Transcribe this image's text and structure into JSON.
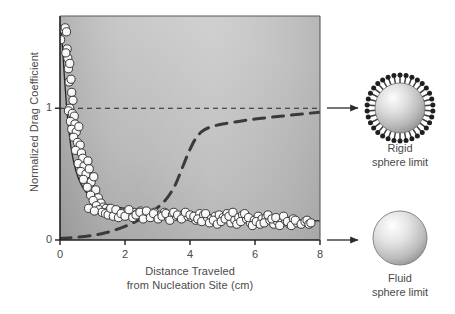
{
  "figure": {
    "background": "#ffffff",
    "plot_bg_light": "#c8c8c8",
    "plot_bg_dark": "#9e9e9e",
    "axis_color": "#222222",
    "text_color": "#4a4a4a",
    "marker_fill": "#f2f2f2",
    "marker_edge": "#3a3a3a"
  },
  "chart_data": {
    "type": "scatter",
    "title": "",
    "subtitle": "",
    "xlabel": "Distance Traveled from Nucleation Site (cm)",
    "xlabel_lines": [
      "Distance Traveled",
      "from Nucleation Site (cm)"
    ],
    "ylabel": "Normalized Drag Coefficient",
    "xlim": [
      0,
      8
    ],
    "ylim": [
      0,
      1.7
    ],
    "xticks": [
      0,
      2,
      4,
      6,
      8
    ],
    "xticklabels": [
      "0",
      "2",
      "4",
      "6",
      "8"
    ],
    "yticks": [
      0,
      1
    ],
    "yticklabels": [
      "0",
      "1"
    ],
    "grid": false,
    "legend": "none",
    "series": [
      {
        "name": "Measured normalized drag coefficient",
        "type": "scatter",
        "marker": "filled-circle",
        "points": [
          [
            0.02,
            1.52
          ],
          [
            0.1,
            1.6
          ],
          [
            0.16,
            1.61
          ],
          [
            0.2,
            1.58
          ],
          [
            0.22,
            1.45
          ],
          [
            0.24,
            1.38
          ],
          [
            0.26,
            1.3
          ],
          [
            0.18,
            1.42
          ],
          [
            0.3,
            1.34
          ],
          [
            0.28,
            1.2
          ],
          [
            0.34,
            1.22
          ],
          [
            0.36,
            1.12
          ],
          [
            0.4,
            1.06
          ],
          [
            0.3,
            1.0
          ],
          [
            0.26,
            0.98
          ],
          [
            0.38,
            0.96
          ],
          [
            0.44,
            0.94
          ],
          [
            0.32,
            0.9
          ],
          [
            0.46,
            0.88
          ],
          [
            0.36,
            0.84
          ],
          [
            0.5,
            0.82
          ],
          [
            0.58,
            0.86
          ],
          [
            0.42,
            0.78
          ],
          [
            0.54,
            0.74
          ],
          [
            0.62,
            0.72
          ],
          [
            0.48,
            0.68
          ],
          [
            0.66,
            0.66
          ],
          [
            0.7,
            0.62
          ],
          [
            0.56,
            0.58
          ],
          [
            0.74,
            0.56
          ],
          [
            0.86,
            0.6
          ],
          [
            0.64,
            0.52
          ],
          [
            0.8,
            0.5
          ],
          [
            0.9,
            0.54
          ],
          [
            0.72,
            0.46
          ],
          [
            0.96,
            0.44
          ],
          [
            1.04,
            0.48
          ],
          [
            0.84,
            0.4
          ],
          [
            1.1,
            0.38
          ],
          [
            0.94,
            0.34
          ],
          [
            1.18,
            0.32
          ],
          [
            1.02,
            0.3
          ],
          [
            1.26,
            0.28
          ],
          [
            1.12,
            0.26
          ],
          [
            0.88,
            0.24
          ],
          [
            1.34,
            0.25
          ],
          [
            1.2,
            0.23
          ],
          [
            1.42,
            0.24
          ],
          [
            1.06,
            0.22
          ],
          [
            1.5,
            0.22
          ],
          [
            1.3,
            0.21
          ],
          [
            1.58,
            0.23
          ],
          [
            1.4,
            0.2
          ],
          [
            1.66,
            0.21
          ],
          [
            1.48,
            0.19
          ],
          [
            1.74,
            0.22
          ],
          [
            1.56,
            0.24
          ],
          [
            1.82,
            0.2
          ],
          [
            1.64,
            0.18
          ],
          [
            1.9,
            0.19
          ],
          [
            1.72,
            0.23
          ],
          [
            1.98,
            0.21
          ],
          [
            1.8,
            0.17
          ],
          [
            2.08,
            0.22
          ],
          [
            1.88,
            0.2
          ],
          [
            2.18,
            0.19
          ],
          [
            2.0,
            0.18
          ],
          [
            2.28,
            0.21
          ],
          [
            2.12,
            0.23
          ],
          [
            2.38,
            0.2
          ],
          [
            2.24,
            0.17
          ],
          [
            2.48,
            0.22
          ],
          [
            2.34,
            0.19
          ],
          [
            2.58,
            0.18
          ],
          [
            2.46,
            0.21
          ],
          [
            2.68,
            0.2
          ],
          [
            2.56,
            0.16
          ],
          [
            2.78,
            0.19
          ],
          [
            2.66,
            0.22
          ],
          [
            2.9,
            0.21
          ],
          [
            2.78,
            0.17
          ],
          [
            3.0,
            0.18
          ],
          [
            2.88,
            0.2
          ],
          [
            3.12,
            0.19
          ],
          [
            3.02,
            0.16
          ],
          [
            3.22,
            0.21
          ],
          [
            3.14,
            0.18
          ],
          [
            3.34,
            0.17
          ],
          [
            3.26,
            0.2
          ],
          [
            3.46,
            0.19
          ],
          [
            3.38,
            0.15
          ],
          [
            3.58,
            0.18
          ],
          [
            3.5,
            0.21
          ],
          [
            3.7,
            0.17
          ],
          [
            3.62,
            0.19
          ],
          [
            3.82,
            0.2
          ],
          [
            3.74,
            0.16
          ],
          [
            3.94,
            0.18
          ],
          [
            3.86,
            0.21
          ],
          [
            4.06,
            0.17
          ],
          [
            4.0,
            0.19
          ],
          [
            4.18,
            0.15
          ],
          [
            4.12,
            0.18
          ],
          [
            4.3,
            0.2
          ],
          [
            4.24,
            0.16
          ],
          [
            4.42,
            0.19
          ],
          [
            4.36,
            0.14
          ],
          [
            4.54,
            0.17
          ],
          [
            4.48,
            0.2
          ],
          [
            4.66,
            0.16
          ],
          [
            4.6,
            0.13
          ],
          [
            4.78,
            0.18
          ],
          [
            4.72,
            0.15
          ],
          [
            4.9,
            0.19
          ],
          [
            4.84,
            0.12
          ],
          [
            5.02,
            0.17
          ],
          [
            4.96,
            0.14
          ],
          [
            5.14,
            0.2
          ],
          [
            5.08,
            0.16
          ],
          [
            5.26,
            0.13
          ],
          [
            5.2,
            0.18
          ],
          [
            5.38,
            0.15
          ],
          [
            5.32,
            0.21
          ],
          [
            5.5,
            0.17
          ],
          [
            5.44,
            0.12
          ],
          [
            5.62,
            0.19
          ],
          [
            5.56,
            0.14
          ],
          [
            5.74,
            0.16
          ],
          [
            5.68,
            0.2
          ],
          [
            5.86,
            0.13
          ],
          [
            5.8,
            0.17
          ],
          [
            5.98,
            0.15
          ],
          [
            5.92,
            0.11
          ],
          [
            6.1,
            0.18
          ],
          [
            6.04,
            0.14
          ],
          [
            6.22,
            0.16
          ],
          [
            6.16,
            0.12
          ],
          [
            6.34,
            0.17
          ],
          [
            6.28,
            0.13
          ],
          [
            6.46,
            0.15
          ],
          [
            6.4,
            0.19
          ],
          [
            6.58,
            0.12
          ],
          [
            6.52,
            0.16
          ],
          [
            6.7,
            0.14
          ],
          [
            6.64,
            0.17
          ],
          [
            6.82,
            0.13
          ],
          [
            6.76,
            0.11
          ],
          [
            6.94,
            0.15
          ],
          [
            6.88,
            0.18
          ],
          [
            7.06,
            0.12
          ],
          [
            7.0,
            0.14
          ],
          [
            7.18,
            0.16
          ],
          [
            7.12,
            0.11
          ],
          [
            7.3,
            0.13
          ],
          [
            7.24,
            0.15
          ],
          [
            7.42,
            0.12
          ],
          [
            7.54,
            0.14
          ],
          [
            7.6,
            0.15
          ],
          [
            7.66,
            0.12
          ],
          [
            7.72,
            0.13
          ]
        ]
      },
      {
        "name": "Fit to measured data (decaying)",
        "type": "line",
        "style": "solid-thin",
        "description": "Steep decay from ~1.6 at x=0 to plateau ~0.14 at x=8",
        "points": [
          [
            0.03,
            1.62
          ],
          [
            0.08,
            1.45
          ],
          [
            0.14,
            1.22
          ],
          [
            0.2,
            1.02
          ],
          [
            0.26,
            0.86
          ],
          [
            0.34,
            0.7
          ],
          [
            0.44,
            0.57
          ],
          [
            0.56,
            0.47
          ],
          [
            0.7,
            0.4
          ],
          [
            0.88,
            0.34
          ],
          [
            1.1,
            0.3
          ],
          [
            1.35,
            0.275
          ],
          [
            1.65,
            0.255
          ],
          [
            2.0,
            0.24
          ],
          [
            2.4,
            0.228
          ],
          [
            2.85,
            0.215
          ],
          [
            3.35,
            0.203
          ],
          [
            3.9,
            0.192
          ],
          [
            4.5,
            0.182
          ],
          [
            5.1,
            0.172
          ],
          [
            5.7,
            0.164
          ],
          [
            6.3,
            0.157
          ],
          [
            6.9,
            0.151
          ],
          [
            7.5,
            0.147
          ],
          [
            8.0,
            0.145
          ]
        ]
      },
      {
        "name": "Rigid sphere transition (dashed sigmoid)",
        "type": "line",
        "style": "dashed-thick",
        "description": "Rises from ~0.01 at x=0, inflection near x=3.9, plateaus just below 1",
        "points": [
          [
            0.0,
            0.012
          ],
          [
            0.5,
            0.02
          ],
          [
            1.0,
            0.035
          ],
          [
            1.4,
            0.055
          ],
          [
            1.8,
            0.085
          ],
          [
            2.2,
            0.125
          ],
          [
            2.6,
            0.175
          ],
          [
            3.0,
            0.245
          ],
          [
            3.3,
            0.32
          ],
          [
            3.55,
            0.42
          ],
          [
            3.75,
            0.54
          ],
          [
            3.95,
            0.66
          ],
          [
            4.15,
            0.76
          ],
          [
            4.35,
            0.82
          ],
          [
            4.6,
            0.855
          ],
          [
            5.0,
            0.88
          ],
          [
            5.5,
            0.9
          ],
          [
            6.0,
            0.918
          ],
          [
            6.5,
            0.932
          ],
          [
            7.0,
            0.945
          ],
          [
            7.5,
            0.958
          ],
          [
            8.0,
            0.97
          ]
        ]
      },
      {
        "name": "Rigid sphere reference line",
        "type": "hline",
        "style": "dashed-thin",
        "y": 1.0
      }
    ]
  },
  "annotations": {
    "arrows": [
      {
        "name": "arrow-to-rigid-sphere",
        "at_y": 1.0
      },
      {
        "name": "arrow-to-fluid-sphere",
        "at_y": 0.0
      }
    ],
    "rigid_sphere": {
      "caption_lines": [
        "Rigid",
        "sphere limit"
      ],
      "caption": "Rigid sphere limit",
      "spikes": 34
    },
    "fluid_sphere": {
      "caption_lines": [
        "Fluid",
        "sphere limit"
      ],
      "caption": "Fluid sphere limit",
      "spikes": 0
    }
  }
}
